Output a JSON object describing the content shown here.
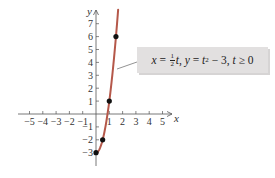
{
  "chart_data": {
    "type": "line",
    "title": "",
    "xlabel": "x",
    "ylabel": "y",
    "xlim": [
      -5.5,
      5.8
    ],
    "ylim": [
      -3.9,
      8
    ],
    "grid": false,
    "x_ticks": [
      "−5",
      "−4",
      "−3",
      "−2",
      "−1",
      "1",
      "2",
      "3",
      "4",
      "5"
    ],
    "y_ticks": [
      "−3",
      "−2",
      "−1",
      "1",
      "2",
      "3",
      "4",
      "5",
      "6",
      "7"
    ],
    "parametric": {
      "x_of_t": "t/2",
      "y_of_t": "t^2 - 3",
      "t_range": [
        0,
        3.33
      ]
    },
    "series": [
      {
        "name": "curve",
        "color": "#b5584a",
        "x": [
          0,
          0.25,
          0.5,
          0.75,
          1,
          1.25,
          1.5,
          1.665
        ],
        "y": [
          -3,
          -2.75,
          -2,
          -0.75,
          1,
          3.25,
          6,
          8.09
        ]
      }
    ],
    "marked_points": [
      {
        "t": 0,
        "x": 0,
        "y": -3
      },
      {
        "t": 1,
        "x": 0.5,
        "y": -2
      },
      {
        "t": 2,
        "x": 1,
        "y": 1
      },
      {
        "t": 3,
        "x": 1.5,
        "y": 6
      }
    ],
    "annotation": "x = ½t, y = t² − 3, t ≥ 0"
  },
  "labels": {
    "x_axis": "x",
    "y_axis": "y",
    "x_ticks": [
      {
        "v": -5,
        "t": "−5"
      },
      {
        "v": -4,
        "t": "−4"
      },
      {
        "v": -3,
        "t": "−3"
      },
      {
        "v": -2,
        "t": "−2"
      },
      {
        "v": -1,
        "t": "−1"
      },
      {
        "v": 1,
        "t": "1"
      },
      {
        "v": 2,
        "t": "2"
      },
      {
        "v": 3,
        "t": "3"
      },
      {
        "v": 4,
        "t": "4"
      },
      {
        "v": 5,
        "t": "5"
      }
    ],
    "y_ticks": [
      {
        "v": -3,
        "t": "−3"
      },
      {
        "v": -2,
        "t": "−2"
      },
      {
        "v": -1,
        "t": "−1"
      },
      {
        "v": 1,
        "t": "1"
      },
      {
        "v": 2,
        "t": "2"
      },
      {
        "v": 3,
        "t": "3"
      },
      {
        "v": 4,
        "t": "4"
      },
      {
        "v": 5,
        "t": "5"
      },
      {
        "v": 6,
        "t": "6"
      },
      {
        "v": 7,
        "t": "7"
      }
    ]
  },
  "equation": {
    "x_part": "x",
    "eq1": " = ",
    "frac_num": "1",
    "frac_den": "2",
    "t1": "t",
    "sep": ", ",
    "y_part": "y",
    "eq2": " = ",
    "t2": "t",
    "exp": "2",
    "rest": " − 3, ",
    "t3": "t",
    "cond": " ≥ 0"
  },
  "colors": {
    "curve": "#b5584a",
    "axis": "#555555",
    "point": "#111111",
    "box": "#e2e0e0"
  }
}
